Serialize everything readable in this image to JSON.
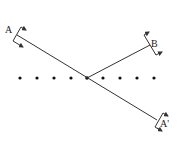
{
  "diagram": {
    "title": "",
    "labels": {
      "a": "A",
      "b": "B",
      "a_prime": "A'"
    },
    "colors": {
      "line": "#333333",
      "dot": "#111111",
      "background": "#ffffff"
    },
    "dots": {
      "count": 9,
      "y": 78,
      "x": [
        20,
        37,
        54,
        71,
        87,
        103,
        120,
        137,
        154
      ]
    },
    "lines": [
      {
        "name": "section-line-a-a-prime",
        "from": [
          17,
          35
        ],
        "to": [
          157,
          120
        ]
      },
      {
        "name": "section-line-b",
        "from": [
          87,
          78
        ],
        "to": [
          150,
          45
        ]
      }
    ],
    "section_markers": [
      {
        "label": "A",
        "position": [
          17,
          35
        ]
      },
      {
        "label": "B",
        "position": [
          150,
          45
        ]
      },
      {
        "label": "A'",
        "position": [
          157,
          120
        ]
      }
    ]
  }
}
